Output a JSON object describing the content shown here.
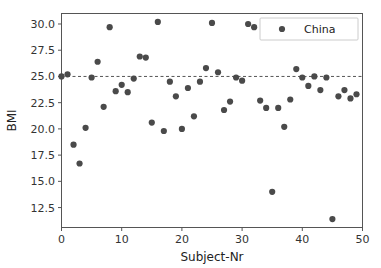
{
  "chart_data": {
    "type": "scatter",
    "title": "",
    "xlabel": "Subject-Nr",
    "ylabel": "BMI",
    "xlim": [
      0,
      50
    ],
    "ylim": [
      10.6,
      31.0
    ],
    "xticks": [
      0,
      10,
      20,
      30,
      40,
      50
    ],
    "xtick_labels": [
      "0",
      "10",
      "20",
      "30",
      "40",
      "50"
    ],
    "yticks": [
      12.5,
      15.0,
      17.5,
      20.0,
      22.5,
      25.0,
      27.5,
      30.0
    ],
    "ytick_labels": [
      "12.5",
      "15.0",
      "17.5",
      "20.0",
      "22.5",
      "25.0",
      "27.5",
      "30.0"
    ],
    "grid": false,
    "marker_color": "#4a4a4a",
    "marker_size": 3.1,
    "reference_line": {
      "orientation": "horizontal",
      "value": 25.0,
      "style": "dashed",
      "color": "#555555"
    },
    "legend": {
      "position": "upper right",
      "entries": [
        {
          "label": "China",
          "marker": "circle",
          "color": "#4a4a4a"
        }
      ]
    },
    "series": [
      {
        "name": "China",
        "color": "#4a4a4a",
        "points": [
          {
            "x": 0,
            "y": 25.0
          },
          {
            "x": 1,
            "y": 25.2
          },
          {
            "x": 2,
            "y": 18.5
          },
          {
            "x": 3,
            "y": 16.7
          },
          {
            "x": 4,
            "y": 20.1
          },
          {
            "x": 5,
            "y": 24.9
          },
          {
            "x": 6,
            "y": 26.4
          },
          {
            "x": 7,
            "y": 22.1
          },
          {
            "x": 8,
            "y": 29.7
          },
          {
            "x": 9,
            "y": 23.6
          },
          {
            "x": 10,
            "y": 24.2
          },
          {
            "x": 11,
            "y": 23.5
          },
          {
            "x": 12,
            "y": 24.8
          },
          {
            "x": 13,
            "y": 26.9
          },
          {
            "x": 14,
            "y": 26.8
          },
          {
            "x": 15,
            "y": 20.6
          },
          {
            "x": 16,
            "y": 30.2
          },
          {
            "x": 17,
            "y": 19.8
          },
          {
            "x": 18,
            "y": 24.5
          },
          {
            "x": 19,
            "y": 23.1
          },
          {
            "x": 20,
            "y": 20.0
          },
          {
            "x": 21,
            "y": 23.9
          },
          {
            "x": 22,
            "y": 21.2
          },
          {
            "x": 23,
            "y": 24.5
          },
          {
            "x": 24,
            "y": 25.8
          },
          {
            "x": 25,
            "y": 30.1
          },
          {
            "x": 26,
            "y": 25.4
          },
          {
            "x": 27,
            "y": 21.8
          },
          {
            "x": 28,
            "y": 22.6
          },
          {
            "x": 29,
            "y": 24.9
          },
          {
            "x": 30,
            "y": 24.6
          },
          {
            "x": 31,
            "y": 30.0
          },
          {
            "x": 32,
            "y": 29.7
          },
          {
            "x": 33,
            "y": 22.7
          },
          {
            "x": 34,
            "y": 22.0
          },
          {
            "x": 35,
            "y": 14.0
          },
          {
            "x": 36,
            "y": 22.0
          },
          {
            "x": 37,
            "y": 20.2
          },
          {
            "x": 38,
            "y": 22.8
          },
          {
            "x": 39,
            "y": 25.7
          },
          {
            "x": 40,
            "y": 24.9
          },
          {
            "x": 41,
            "y": 24.1
          },
          {
            "x": 42,
            "y": 25.0
          },
          {
            "x": 43,
            "y": 23.7
          },
          {
            "x": 44,
            "y": 24.9
          },
          {
            "x": 45,
            "y": 11.4
          },
          {
            "x": 46,
            "y": 23.1
          },
          {
            "x": 47,
            "y": 23.7
          },
          {
            "x": 48,
            "y": 22.9
          },
          {
            "x": 49,
            "y": 23.3
          }
        ]
      }
    ]
  }
}
